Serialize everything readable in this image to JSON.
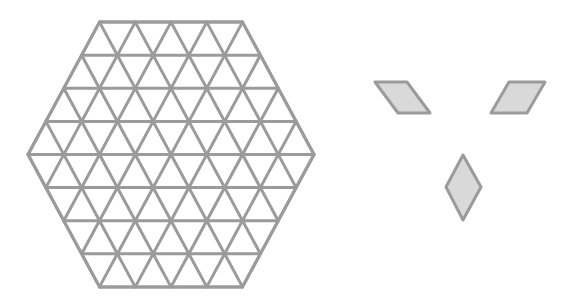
{
  "figure": {
    "width": 574,
    "height": 305,
    "background": "#ffffff"
  },
  "hexagon_grid": {
    "shape": "regular hexagon subdivided into equilateral triangles",
    "triangles_per_side": 4,
    "rows": 8,
    "center": [
      171,
      154.5
    ],
    "triangle_side_px": 35.75,
    "row_height_px": 33.1,
    "stroke_color": "#9b9b9b",
    "stroke_width": 3,
    "fill_color": "#ffffff"
  },
  "rhombus_pieces": [
    {
      "id": "rhombus-left",
      "orientation": "leaning-right",
      "points": [
        [
          375,
          82
        ],
        [
          407,
          82
        ],
        [
          430,
          113
        ],
        [
          398,
          113
        ]
      ],
      "fill": "#d9d9d9",
      "stroke": "#9b9b9b"
    },
    {
      "id": "rhombus-right",
      "orientation": "leaning-left",
      "points": [
        [
          509,
          82
        ],
        [
          545,
          82
        ],
        [
          527,
          113
        ],
        [
          491,
          113
        ]
      ],
      "fill": "#d9d9d9",
      "stroke": "#9b9b9b"
    },
    {
      "id": "rhombus-bottom",
      "orientation": "vertical",
      "points": [
        [
          463,
          155
        ],
        [
          481,
          187
        ],
        [
          463,
          220
        ],
        [
          446,
          187
        ]
      ],
      "fill": "#d9d9d9",
      "stroke": "#9b9b9b"
    }
  ]
}
